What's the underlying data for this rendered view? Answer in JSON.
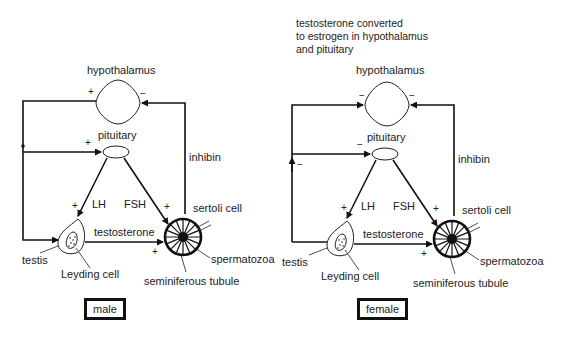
{
  "panels": [
    {
      "id": "male",
      "caption": "male",
      "note": null,
      "labels": {
        "hypothalamus": "hypothalamus",
        "pituitary": "pituitary",
        "inhibin": "inhibin",
        "lh": "LH",
        "fsh": "FSH",
        "testosterone": "testosterone",
        "sertoli": "sertoli cell",
        "spermatozoa": "spermatozoa",
        "tubule": "seminiferous tubule",
        "testis": "testis",
        "leydig": "Leyding cell"
      },
      "signs": {
        "to_hypothalamus_left": "+",
        "to_hypothalamus_right": "−",
        "to_pituitary_left": "+",
        "loop_left": "",
        "lh_arrow": "+",
        "fsh_arrow": "+",
        "testosterone_arrow": "+"
      }
    },
    {
      "id": "female",
      "caption": "female",
      "note": [
        "testosterone converted",
        "to estrogen in hypothalamus",
        "and pituitary"
      ],
      "labels": {
        "hypothalamus": "hypothalamus",
        "pituitary": "pituitary",
        "inhibin": "inhibin",
        "lh": "LH",
        "fsh": "FSH",
        "testosterone": "testosterone",
        "sertoli": "sertoli cell",
        "spermatozoa": "spermatozoa",
        "tubule": "seminiferous tubule",
        "testis": "testis",
        "leydig": "Leyding cell"
      },
      "signs": {
        "to_hypothalamus_left": "−",
        "to_hypothalamus_right": "−",
        "to_pituitary_left": "−",
        "loop_left": "−",
        "lh_arrow": "+",
        "fsh_arrow": "+",
        "testosterone_arrow": "+"
      }
    }
  ]
}
